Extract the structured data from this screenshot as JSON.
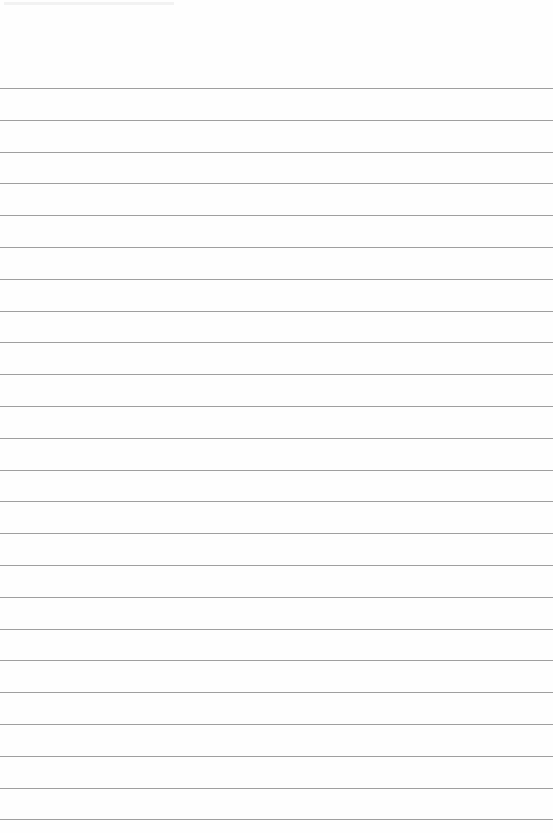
{
  "page": {
    "type": "lined-paper",
    "background_color": "#fefefe",
    "line_color": "#8e8e8e",
    "line_count": 24,
    "first_line_y": 88,
    "line_spacing": 31.8
  }
}
